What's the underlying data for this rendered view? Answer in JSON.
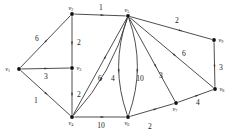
{
  "figure": {
    "width": 242,
    "height": 140,
    "background_color": "#ffffff",
    "edge_color": "#3a3a3a",
    "node_color": "#111111",
    "label_color": "#1a1a1a"
  },
  "nodes": [
    {
      "id": "v1",
      "base": "v",
      "sub": "1",
      "x": 19,
      "y": 69,
      "label_dx": -9,
      "label_dy": 1.5
    },
    {
      "id": "v2",
      "base": "v",
      "sub": "2",
      "x": 72,
      "y": 14,
      "label_dx": -1,
      "label_dy": -4.5
    },
    {
      "id": "v3",
      "base": "v",
      "sub": "3",
      "x": 72,
      "y": 68,
      "label_dx": 4.5,
      "label_dy": 1.5
    },
    {
      "id": "v4",
      "base": "v",
      "sub": "4",
      "x": 72,
      "y": 117,
      "label_dx": -1,
      "label_dy": 7.5
    },
    {
      "id": "v5",
      "base": "v",
      "sub": "5",
      "x": 128,
      "y": 16,
      "label_dx": -1,
      "label_dy": -4.5
    },
    {
      "id": "v6",
      "base": "v",
      "sub": "6",
      "x": 128,
      "y": 117,
      "label_dx": -1,
      "label_dy": 7.5
    },
    {
      "id": "v7",
      "base": "v",
      "sub": "7",
      "x": 176,
      "y": 103,
      "label_dx": -1,
      "label_dy": 7.5
    },
    {
      "id": "v8",
      "base": "v",
      "sub": "8",
      "x": 215,
      "y": 89,
      "label_dx": 4.5,
      "label_dy": 1.5
    },
    {
      "id": "v9",
      "base": "v",
      "sub": "9",
      "x": 214,
      "y": 40,
      "label_dx": 4.5,
      "label_dy": 1.5
    }
  ],
  "edges": [
    {
      "id": "e-v1-v2",
      "from": "v1",
      "to": "v2",
      "weight": "6",
      "shape": "line",
      "label_x": 37,
      "label_y": 41,
      "arrow_t": 0.52
    },
    {
      "id": "e-v1-v3",
      "from": "v1",
      "to": "v3",
      "weight": "3",
      "shape": "line",
      "label_x": 46,
      "label_y": 79,
      "arrow_t": 0.52
    },
    {
      "id": "e-v1-v4",
      "from": "v1",
      "to": "v4",
      "weight": "1",
      "shape": "line",
      "label_x": 36,
      "label_y": 103,
      "arrow_t": 0.52
    },
    {
      "id": "e-v2-v5",
      "from": "v2",
      "to": "v5",
      "weight": "1",
      "shape": "line",
      "label_x": 101,
      "label_y": 10,
      "arrow_t": 0.55
    },
    {
      "id": "e-v2-v3",
      "from": "v2",
      "to": "v3",
      "weight": "2",
      "shape": "line",
      "label_x": 79,
      "label_y": 45,
      "arrow_t": 0.55
    },
    {
      "id": "e-v3-v4",
      "from": "v3",
      "to": "v4",
      "weight": "2",
      "shape": "line",
      "label_x": 79,
      "label_y": 97,
      "arrow_t": 0.55
    },
    {
      "id": "e-v4-v5",
      "from": "v4",
      "to": "v5",
      "weight": "6",
      "shape": "line",
      "label_x": 100,
      "label_y": 81,
      "arrow_t": 0.6
    },
    {
      "id": "e-v4-v6",
      "from": "v4",
      "to": "v6",
      "weight": "10",
      "shape": "line",
      "label_x": 101,
      "label_y": 128,
      "arrow_t": 0.55
    },
    {
      "id": "e-v5-v4",
      "from": "v5",
      "to": "v4",
      "weight": "4",
      "shape": "curve",
      "bow": -7,
      "label_x": 113,
      "label_y": 81,
      "arrow_t": 0.6
    },
    {
      "id": "e-v5-v6a",
      "from": "v5",
      "to": "v6",
      "weight": "10",
      "shape": "curve",
      "bow": 9,
      "label_x": 140,
      "label_y": 81,
      "arrow_t": 0.55
    },
    {
      "id": "e-v5-v6b",
      "from": "v5",
      "to": "v6",
      "weight": "",
      "shape": "curve",
      "bow": -9,
      "label_x": 0,
      "label_y": 0,
      "arrow_t": 0.55
    },
    {
      "id": "e-v5-v7",
      "from": "v5",
      "to": "v7",
      "weight": "3",
      "shape": "line",
      "label_x": 161,
      "label_y": 78,
      "arrow_t": 0.58
    },
    {
      "id": "e-v5-v8",
      "from": "v5",
      "to": "v8",
      "weight": "6",
      "shape": "line",
      "label_x": 184,
      "label_y": 56,
      "arrow_t": 0.54
    },
    {
      "id": "e-v5-v9",
      "from": "v5",
      "to": "v9",
      "weight": "2",
      "shape": "line",
      "label_x": 177,
      "label_y": 23,
      "arrow_t": 0.62
    },
    {
      "id": "e-v6-v7",
      "from": "v6",
      "to": "v7",
      "weight": "2",
      "shape": "line",
      "label_x": 150,
      "label_y": 129,
      "arrow_t": 0.58
    },
    {
      "id": "e-v7-v8",
      "from": "v7",
      "to": "v8",
      "weight": "4",
      "shape": "line",
      "label_x": 198,
      "label_y": 105,
      "arrow_t": 0.55
    },
    {
      "id": "e-v9-v8",
      "from": "v9",
      "to": "v8",
      "weight": "3",
      "shape": "line",
      "label_x": 221,
      "label_y": 70,
      "arrow_t": 0.55
    }
  ]
}
